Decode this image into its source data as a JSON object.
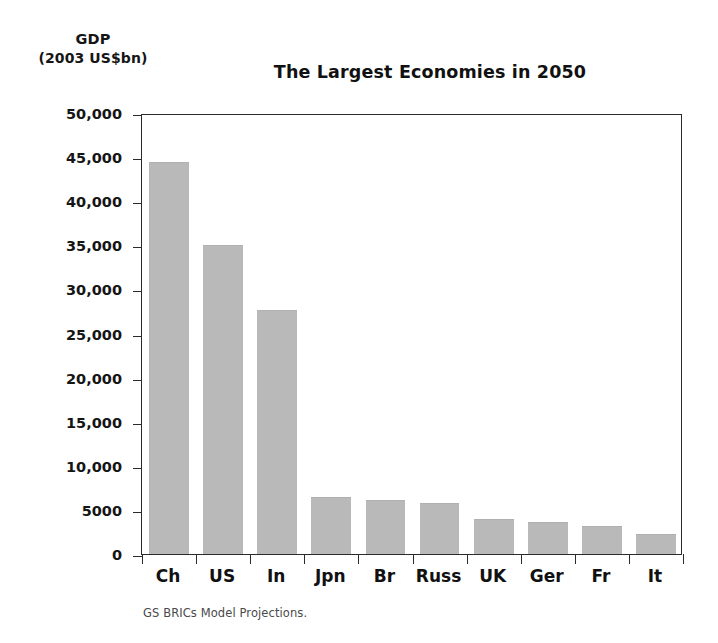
{
  "axis_caption": {
    "line1": "GDP",
    "line2": "(2003 US$bn)"
  },
  "source_note": "GS BRICs Model Projections.",
  "style": {
    "bar_color": "#b9b9b9",
    "axis_color": "#2b2b2b",
    "text_color": "#111111",
    "note_color": "#4a4a4a",
    "background": "#ffffff"
  },
  "chart_data": {
    "type": "bar",
    "title": "The Largest Economies in 2050",
    "xlabel": "",
    "ylabel": "GDP (2003 US$bn)",
    "ylim": [
      0,
      50000
    ],
    "ytick_values": [
      0,
      5000,
      10000,
      15000,
      20000,
      25000,
      30000,
      35000,
      40000,
      45000,
      50000
    ],
    "ytick_labels": [
      "0",
      "5000",
      "10,000",
      "15,000",
      "20,000",
      "25,000",
      "30,000",
      "35,000",
      "40,000",
      "45,000",
      "50,000"
    ],
    "grid": false,
    "legend": false,
    "categories": [
      "Ch",
      "US",
      "In",
      "Jpn",
      "Br",
      "Russ",
      "UK",
      "Ger",
      "Fr",
      "It"
    ],
    "category_full_names": [
      "China",
      "United States",
      "India",
      "Japan",
      "Brazil",
      "Russia",
      "United Kingdom",
      "Germany",
      "France",
      "Italy"
    ],
    "values": [
      44300,
      34900,
      27500,
      6400,
      6000,
      5700,
      3800,
      3500,
      3100,
      2200
    ],
    "source": "GS BRICs Model Projections."
  }
}
